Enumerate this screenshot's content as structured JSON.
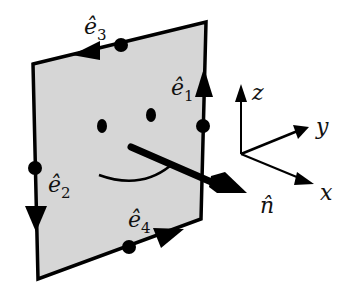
{
  "diagram": {
    "colors": {
      "panel_fill": "#d6d6d6",
      "stroke": "#000000",
      "background": "#ffffff"
    },
    "edges": [
      {
        "id": "e1",
        "label": "ê",
        "subscript": "1",
        "direction": "up"
      },
      {
        "id": "e2",
        "label": "ê",
        "subscript": "2",
        "direction": "down"
      },
      {
        "id": "e3",
        "label": "ê",
        "subscript": "3",
        "direction": "left"
      },
      {
        "id": "e4",
        "label": "ê",
        "subscript": "4",
        "direction": "right"
      }
    ],
    "normal": {
      "label": "n̂"
    },
    "axes": {
      "x": "x",
      "y": "y",
      "z": "z"
    },
    "face": "smiley"
  }
}
